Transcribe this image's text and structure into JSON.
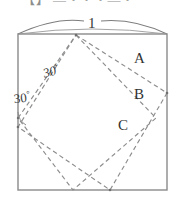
{
  "figure": {
    "caption_clipped_top": "【】 ―・・・―・",
    "dimension": {
      "label": "1",
      "icon": "dimension-arc-icon"
    },
    "angles": [
      {
        "id": "inner",
        "value": "30",
        "degree_symbol": "°"
      },
      {
        "id": "left-edge",
        "value": "30",
        "degree_symbol": "°"
      }
    ],
    "regions": [
      {
        "id": "A",
        "label": "A"
      },
      {
        "id": "B",
        "label": "B"
      },
      {
        "id": "C",
        "label": "C"
      }
    ],
    "colors": {
      "background": "#ffffff",
      "outer_square_stroke": "#8a8a8a",
      "dashed_stroke": "#8c8c8c",
      "arc_stroke": "#7d7d7d",
      "text": "#333333"
    },
    "geometry": {
      "outer_square": {
        "x": 18,
        "y": 34,
        "width": 149,
        "height": 156
      },
      "dashed_square_1": [
        [
          76,
          35
        ],
        [
          167,
          93
        ],
        [
          110,
          190
        ],
        [
          18,
          127
        ]
      ],
      "dashed_square_2": [
        [
          76,
          35
        ],
        [
          156,
          118
        ],
        [
          73,
          190
        ],
        [
          18,
          118
        ]
      ]
    }
  }
}
